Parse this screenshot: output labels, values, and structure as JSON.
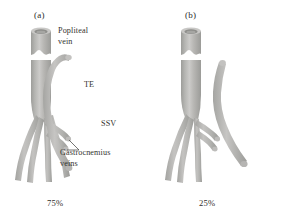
{
  "figure": {
    "type": "anatomical-diagram",
    "background_color": "#ffffff",
    "vessel_color": "#b0b0ae",
    "vessel_shade_color": "#9a9a97",
    "vessel_highlight_color": "#d8d8d6",
    "valve_band_color": "#ffffff",
    "text_color": "#35332f"
  },
  "panels": [
    {
      "id": "a",
      "label": "(a)",
      "percent": "75%",
      "description": "SSV joins popliteal vein via thigh extension"
    },
    {
      "id": "b",
      "label": "(b)",
      "percent": "25%",
      "description": "SSV runs separately, no popliteal junction"
    }
  ],
  "annotations": {
    "popliteal_vein": {
      "line1": "Popliteal",
      "line2": "vein"
    },
    "te": "TE",
    "ssv": "SSV",
    "gastrocnemius_veins": {
      "line1": "Gastrocnemius",
      "line2": "veins"
    }
  }
}
